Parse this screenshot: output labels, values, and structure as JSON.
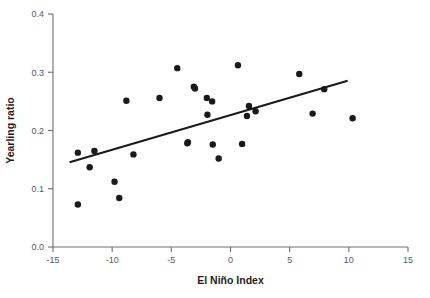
{
  "chart_data": {
    "type": "scatter",
    "title": "",
    "xlabel": "El Niño Index",
    "ylabel": "Yearling ratio",
    "xlim": [
      -15,
      15
    ],
    "ylim": [
      0.0,
      0.4
    ],
    "xticks": [
      -15,
      -10,
      -5,
      0,
      5,
      10,
      15
    ],
    "xtick_labels": [
      "-15",
      "-10",
      "-5",
      "0",
      "5",
      "10",
      "15"
    ],
    "yticks": [
      0.0,
      0.1,
      0.2,
      0.3,
      0.4
    ],
    "ytick_labels": [
      "0.0",
      "0.1",
      "0.2",
      "0.3",
      "0.4"
    ],
    "grid": false,
    "legend": null,
    "marker_color": "#1a1a1a",
    "marker_size": 3.2,
    "axis_color": "#6e6e6e",
    "series": [
      {
        "name": "Yearling ratio vs El Niño Index",
        "points": [
          {
            "x": -12.9,
            "y": 0.162
          },
          {
            "x": -12.9,
            "y": 0.073
          },
          {
            "x": -11.9,
            "y": 0.137
          },
          {
            "x": -11.5,
            "y": 0.165
          },
          {
            "x": -9.8,
            "y": 0.112
          },
          {
            "x": -9.4,
            "y": 0.084
          },
          {
            "x": -8.8,
            "y": 0.251
          },
          {
            "x": -8.2,
            "y": 0.159
          },
          {
            "x": -6.0,
            "y": 0.256
          },
          {
            "x": -4.5,
            "y": 0.307
          },
          {
            "x": -3.6,
            "y": 0.18
          },
          {
            "x": -3.65,
            "y": 0.178
          },
          {
            "x": -3.1,
            "y": 0.275
          },
          {
            "x": -3.0,
            "y": 0.272
          },
          {
            "x": -2.0,
            "y": 0.256
          },
          {
            "x": -1.95,
            "y": 0.227
          },
          {
            "x": -1.55,
            "y": 0.25
          },
          {
            "x": -1.5,
            "y": 0.176
          },
          {
            "x": -1.0,
            "y": 0.152
          },
          {
            "x": 0.63,
            "y": 0.312
          },
          {
            "x": 0.98,
            "y": 0.177
          },
          {
            "x": 1.39,
            "y": 0.225
          },
          {
            "x": 1.56,
            "y": 0.242
          },
          {
            "x": 2.12,
            "y": 0.233
          },
          {
            "x": 5.81,
            "y": 0.297
          },
          {
            "x": 6.94,
            "y": 0.229
          },
          {
            "x": 7.92,
            "y": 0.271
          },
          {
            "x": 10.32,
            "y": 0.221
          }
        ]
      }
    ],
    "trendline": {
      "type": "linear",
      "x_start": -13.6,
      "y_start": 0.1455,
      "x_end": 9.9,
      "y_end": 0.2855,
      "slope": 0.00596,
      "intercept": 0.2266
    }
  }
}
